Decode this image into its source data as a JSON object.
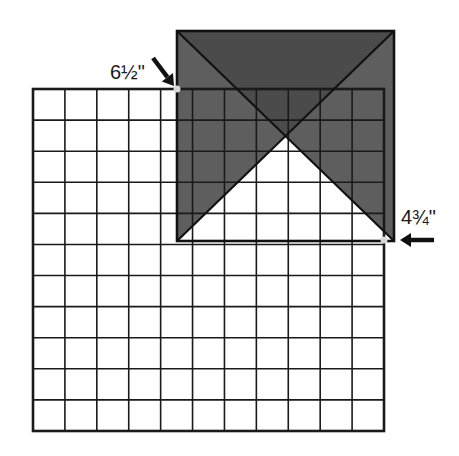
{
  "diagram": {
    "grid": {
      "columns": 11,
      "rows": 11,
      "x": 33,
      "y": 89,
      "width": 351,
      "height": 342,
      "line_color": "#1a1a1a",
      "fill": "#ffffff"
    },
    "square": {
      "x": 177,
      "y": 31,
      "width": 217,
      "height": 210,
      "top_triangle_color": "#4b4b4b",
      "side_triangle_color": "#5e5e5e",
      "bottom_triangle_color": "transparent",
      "border_color": "#111111"
    },
    "markers": [
      {
        "name": "top-left-marker",
        "x": 177,
        "y": 89,
        "color": "#d8d8d8"
      },
      {
        "name": "bottom-right-marker",
        "x": 384,
        "y": 240,
        "color": "#d8d8d8"
      }
    ],
    "labels": {
      "top": "6½\"",
      "right": "4¾\""
    },
    "arrows": [
      {
        "name": "diagonal-arrow",
        "direction": "down-right",
        "from": [
          153,
          58
        ],
        "to": [
          174,
          86
        ]
      },
      {
        "name": "left-arrow",
        "direction": "left",
        "from": [
          434,
          240
        ],
        "to": [
          400,
          240
        ]
      }
    ]
  }
}
